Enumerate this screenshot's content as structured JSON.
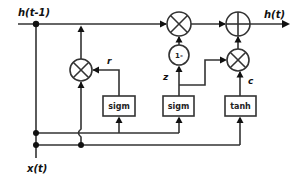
{
  "diagram": {
    "type": "GRU cell block diagram",
    "inputs": {
      "hidden_prev": "h(t-1)",
      "input": "x(t)"
    },
    "output": "h(t)",
    "gates": {
      "reset": {
        "label": "r",
        "activation": "sigm"
      },
      "update": {
        "label": "z",
        "activation": "sigm"
      },
      "candidate": {
        "label": "c",
        "activation": "tanh"
      }
    },
    "operators": {
      "one_minus": "1-",
      "multiply": "×",
      "add": "+"
    },
    "colors": {
      "line": "#333333",
      "background": "#ffffff",
      "text": "#111111"
    }
  }
}
